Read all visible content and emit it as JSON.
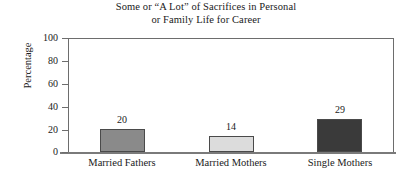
{
  "chart_data": {
    "type": "bar",
    "title": "Some or “A Lot” of Sacrifices in Personal or Family Life for Career",
    "title_lines": [
      "Some or “A Lot” of Sacrifices in Personal",
      "or Family Life for Career"
    ],
    "categories": [
      "Married Fathers",
      "Married Mothers",
      "Single Mothers"
    ],
    "values": [
      20,
      14,
      29
    ],
    "bar_colors": [
      "#8a8a8a",
      "#dcdcdc",
      "#3a3a3a"
    ],
    "xlabel": "",
    "ylabel": "Percentage",
    "ylim": [
      0,
      100
    ],
    "ytick_labels": [
      "100",
      "80",
      "60",
      "40",
      "20",
      "0"
    ],
    "ytick_values": [
      100,
      80,
      60,
      40,
      20,
      0
    ],
    "grid": false,
    "legend": "none",
    "data_labels_shown": true
  },
  "colors": {
    "axis": "#6d6d6d",
    "baseline": "#7a7a7a",
    "text": "#1a1a1a",
    "background": "#ffffff",
    "bar_outline": "#4a4a4a"
  }
}
